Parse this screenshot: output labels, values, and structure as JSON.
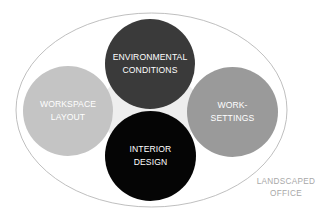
{
  "diagram": {
    "title": "",
    "container": {
      "label": "LANDSCAPED\nOFFICE",
      "stroke_color": "#b8b8b8"
    },
    "connector_color": "#ececec",
    "nodes": [
      {
        "id": "environmental-conditions",
        "label": "ENVIRONMENTAL\nCONDITIONS",
        "position": "top",
        "fill": "#3a3a3a"
      },
      {
        "id": "workspace-layout",
        "label": "WORKSPACE\nLAYOUT",
        "position": "left",
        "fill": "#c4c4c4"
      },
      {
        "id": "work-settings",
        "label": "WORK-\nSETTINGS",
        "position": "right",
        "fill": "#9a9a9a"
      },
      {
        "id": "interior-design",
        "label": "INTERIOR\nDESIGN",
        "position": "bottom",
        "fill": "#050505"
      }
    ]
  }
}
